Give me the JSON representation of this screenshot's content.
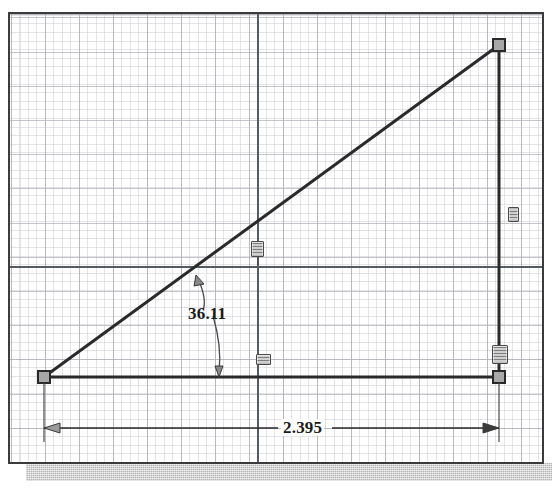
{
  "app": {
    "kind": "cad-sketch-viewport",
    "title": "Sketch"
  },
  "canvas": {
    "width": 552,
    "height": 492,
    "background_color": "#ffffff",
    "frame_border_color": "#3b3b3b",
    "shadow_color": "#b4b4b4"
  },
  "grid": {
    "visible": true,
    "minor_spacing_px": 8.5,
    "major_spacing_px": 34,
    "minor_color": "#969698",
    "major_color": "#787887",
    "axis_color": "#555b63"
  },
  "origin": {
    "label": "origin",
    "x_px": 248,
    "y_px": 264
  },
  "geometry": {
    "entity_color": "#2a2a2a",
    "endpoint_fill": "#a8a8a8",
    "endpoint_stroke": "#2a2a2a",
    "points": [
      {
        "name": "vertex-bottom-left",
        "x": 42,
        "y": 375
      },
      {
        "name": "vertex-bottom-right",
        "x": 497,
        "y": 375
      },
      {
        "name": "vertex-top-right",
        "x": 497,
        "y": 43
      }
    ],
    "lines": [
      {
        "name": "line-horizontal",
        "from": "vertex-bottom-left",
        "to": "vertex-bottom-right"
      },
      {
        "name": "line-vertical",
        "from": "vertex-bottom-right",
        "to": "vertex-top-right"
      },
      {
        "name": "line-hypotenuse",
        "from": "vertex-bottom-left",
        "to": "vertex-top-right"
      }
    ]
  },
  "dimensions": {
    "angular": {
      "name": "angle-dimension",
      "value": "36.11",
      "unit": "deg",
      "text": "36.11",
      "text_x": 186,
      "text_y": 310,
      "arc_start": {
        "x": 196,
        "y": 277
      },
      "arc_end": {
        "x": 214,
        "y": 371
      }
    },
    "linear": {
      "name": "length-dimension",
      "value": "2.395",
      "text": "2.395",
      "text_x": 302,
      "text_y": 418,
      "line_y": 426,
      "from_x": 42,
      "to_x": 497,
      "witness_top_y": 379
    }
  },
  "constraints": [
    {
      "name": "constraint-badge-hypotenuse",
      "icon": "coincident-constraint-icon",
      "type": "coincident",
      "x": 247,
      "y": 237,
      "style": "coinc"
    },
    {
      "name": "constraint-badge-horizontal-line",
      "icon": "horizontal-constraint-icon",
      "type": "horizontal",
      "x": 253,
      "y": 350,
      "style": "horiz"
    },
    {
      "name": "constraint-badge-vertical-line",
      "icon": "vertical-constraint-icon",
      "type": "vertical",
      "x": 509,
      "y": 203,
      "style": "vert"
    },
    {
      "name": "constraint-badge-corner-fix",
      "icon": "fixed-constraint-icon",
      "type": "fixed",
      "x": 491,
      "y": 343,
      "style": "tall"
    }
  ]
}
